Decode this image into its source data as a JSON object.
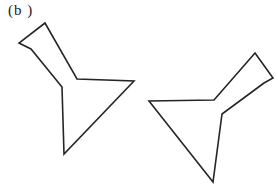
{
  "figure": {
    "label": "(b )",
    "background_color": "#ffffff",
    "stroke_color": "#262626",
    "stroke_width": "1.6",
    "shapes": [
      {
        "name": "flask-outline-left",
        "description": "flask-shaped polygon, neck pointing up-left, flared lip tip at top",
        "points": [
          [
            45,
            23
          ],
          [
            19,
            43
          ],
          [
            31,
            49
          ],
          [
            62,
            87
          ],
          [
            64,
            154
          ],
          [
            134,
            81
          ],
          [
            77,
            79
          ]
        ]
      },
      {
        "name": "flask-outline-right",
        "description": "flask-shaped polygon, neck pointing up-right, flared lip tip at top",
        "points": [
          [
            255,
            53
          ],
          [
            273,
            78
          ],
          [
            264,
            83
          ],
          [
            222,
            114
          ],
          [
            213,
            182
          ],
          [
            149,
            101
          ],
          [
            214,
            100
          ]
        ]
      }
    ]
  }
}
